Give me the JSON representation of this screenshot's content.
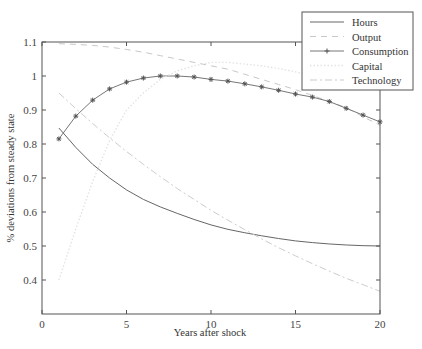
{
  "chart_data": {
    "type": "line",
    "title": "",
    "xlabel": "Years after shock",
    "ylabel": "% deviations from steady state",
    "xlim": [
      0,
      20
    ],
    "ylim": [
      0.3,
      1.1
    ],
    "xticks": [
      0,
      5,
      10,
      15,
      20
    ],
    "yticks": [
      0.4,
      0.5,
      0.6,
      0.7,
      0.8,
      0.9,
      1,
      1.1
    ],
    "grid": false,
    "legend_position": "top-right (outside/overlapping top edge)",
    "x": [
      1,
      2,
      3,
      4,
      5,
      6,
      7,
      8,
      9,
      10,
      11,
      12,
      13,
      14,
      15,
      16,
      17,
      18,
      19,
      20
    ],
    "series": [
      {
        "name": "Hours",
        "style": "solid",
        "color": "#666666",
        "values": [
          0.847,
          0.79,
          0.74,
          0.7,
          0.665,
          0.637,
          0.615,
          0.596,
          0.578,
          0.562,
          0.549,
          0.539,
          0.53,
          0.522,
          0.515,
          0.51,
          0.506,
          0.503,
          0.501,
          0.5
        ]
      },
      {
        "name": "Output",
        "style": "dashed",
        "color": "#c8c8c8",
        "values": [
          1.095,
          1.093,
          1.09,
          1.085,
          1.078,
          1.07,
          1.06,
          1.05,
          1.04,
          1.03,
          1.02,
          1.005,
          0.99,
          0.975,
          0.96,
          0.943,
          0.925,
          0.907,
          0.88,
          0.855
        ]
      },
      {
        "name": "Consumption",
        "style": "solid-star",
        "color": "#777777",
        "values": [
          0.815,
          0.882,
          0.929,
          0.962,
          0.982,
          0.994,
          1.0,
          1.0,
          0.997,
          0.99,
          0.985,
          0.977,
          0.968,
          0.958,
          0.947,
          0.938,
          0.925,
          0.905,
          0.885,
          0.865
        ]
      },
      {
        "name": "Capital",
        "style": "dotted",
        "color": "#e3e3e3",
        "values": [
          0.4,
          0.55,
          0.69,
          0.81,
          0.9,
          0.95,
          0.99,
          1.015,
          1.03,
          1.04,
          1.04,
          1.035,
          1.03,
          1.022,
          1.012,
          1.0,
          0.99,
          0.98,
          0.97,
          0.96
        ]
      },
      {
        "name": "Technology",
        "style": "dash-dot",
        "color": "#cccccc",
        "values": [
          0.95,
          0.904,
          0.86,
          0.818,
          0.778,
          0.74,
          0.704,
          0.669,
          0.637,
          0.605,
          0.576,
          0.548,
          0.521,
          0.495,
          0.471,
          0.448,
          0.426,
          0.405,
          0.386,
          0.367
        ]
      }
    ]
  }
}
